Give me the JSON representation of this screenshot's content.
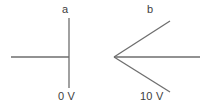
{
  "figure": {
    "background_color": "#ffffff",
    "line_color": "#6e6e6e",
    "text_color": "#3d3d3d",
    "width": 207,
    "height": 111,
    "panels": [
      {
        "id": "panel-a",
        "label": "a",
        "voltage_label": "0 V",
        "shape": "perpendicular-junction",
        "description": "A horizontal line meeting a vertical line at a right angle (T-junction rotated)",
        "vertex": {
          "x": 69,
          "y": 57
        },
        "arms": [
          {
            "name": "arm-horizontal-left",
            "from": {
              "x": 11,
              "y": 57
            },
            "to": {
              "x": 69,
              "y": 57
            }
          },
          {
            "name": "arm-vertical-up",
            "from": {
              "x": 69,
              "y": 18
            },
            "to": {
              "x": 69,
              "y": 57
            }
          },
          {
            "name": "arm-vertical-down",
            "from": {
              "x": 69,
              "y": 57
            },
            "to": {
              "x": 69,
              "y": 88
            }
          }
        ]
      },
      {
        "id": "panel-b",
        "label": "b",
        "voltage_label": "10 V",
        "shape": "three-way-vertex",
        "description": "A vertex with three lines radiating right: up-right, horizontal, down-right",
        "vertex": {
          "x": 114,
          "y": 57
        },
        "arms": [
          {
            "name": "arm-upper-right",
            "from": {
              "x": 114,
              "y": 57
            },
            "to": {
              "x": 170,
              "y": 21
            }
          },
          {
            "name": "arm-horizontal-right",
            "from": {
              "x": 114,
              "y": 57
            },
            "to": {
              "x": 200,
              "y": 57
            }
          },
          {
            "name": "arm-lower-right",
            "from": {
              "x": 114,
              "y": 57
            },
            "to": {
              "x": 170,
              "y": 92
            }
          }
        ]
      }
    ]
  }
}
